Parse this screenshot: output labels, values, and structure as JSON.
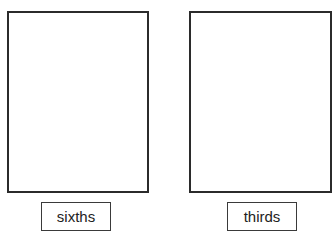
{
  "panels": [
    {
      "id": "left",
      "label": "sixths"
    },
    {
      "id": "right",
      "label": "thirds"
    }
  ],
  "colors": {
    "border": "#2b2b2b",
    "background": "#ffffff",
    "text": "#222222"
  }
}
